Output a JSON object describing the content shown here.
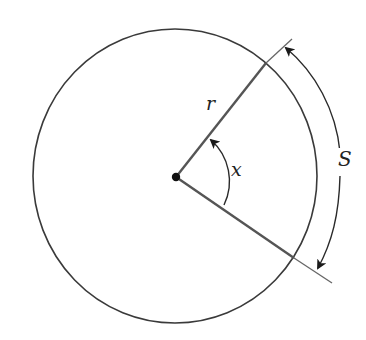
{
  "diagram": {
    "title": "",
    "type": "geometry-arc-length",
    "labels": {
      "radius": "r",
      "angle": "x",
      "arc_length": "S"
    },
    "colors": {
      "stroke": "#3a3a3a",
      "radius_stroke": "#555555",
      "background": "#ffffff"
    },
    "elements": [
      "circle",
      "center-point",
      "radius-upper",
      "radius-lower",
      "angle-arc-arrow",
      "arc-length-arrow",
      "tick-upper",
      "tick-lower"
    ]
  }
}
